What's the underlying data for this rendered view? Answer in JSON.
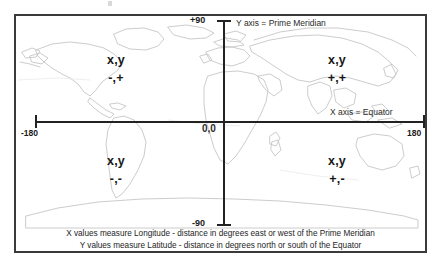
{
  "figure": {
    "title_alt": "Latitude and Longitude Coordinate System",
    "axes": {
      "y_top_label": "+90",
      "y_bottom_label": "-90",
      "x_left_label": "-180",
      "x_right_label": "180",
      "origin_label": "0,0",
      "y_axis_name": "Y axis = Prime Meridian",
      "x_axis_name": "X axis = Equator"
    },
    "quadrants": [
      {
        "id": "upper-left",
        "vars": "x,y",
        "signs": "-,+"
      },
      {
        "id": "upper-right",
        "vars": "x,y",
        "signs": "+,+"
      },
      {
        "id": "lower-left",
        "vars": "x,y",
        "signs": "-,-"
      },
      {
        "id": "lower-right",
        "vars": "x,y",
        "signs": "+,-"
      }
    ],
    "caption": {
      "line1": "X values measure Longitude - distance in degrees east or west of the Prime Meridian",
      "line2": "Y values measure Latitude - distance in degrees north or south of the Equator"
    },
    "colors": {
      "axis": "#222222",
      "border": "#3a3a3a",
      "coastline": "#9a9a9a",
      "text": "#1a1a1a",
      "background": "#ffffff"
    }
  }
}
